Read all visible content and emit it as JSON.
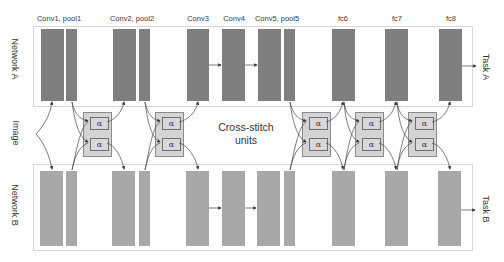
{
  "colors": {
    "network_a_block": "#7f7f7f",
    "network_b_block": "#a8a8a8",
    "cross_stitch_fill": "#d4d4d4",
    "box_border": "#d6d6d6"
  },
  "networks": {
    "a": {
      "label": "Network A",
      "task": "Task A"
    },
    "b": {
      "label": "Network B",
      "task": "Task B"
    }
  },
  "input_label": "Image",
  "cross_stitch_label_line1": "Cross-stitch",
  "cross_stitch_label_line2": "units",
  "alpha_symbol": "α",
  "layers": [
    {
      "label": "Conv1, pool1"
    },
    {
      "label": "Conv2, pool2"
    },
    {
      "label": "Conv3"
    },
    {
      "label": "Conv4"
    },
    {
      "label": "Conv5, pool5"
    },
    {
      "label": "fc6"
    },
    {
      "label": "fc7"
    },
    {
      "label": "fc8"
    }
  ],
  "cross_stitch_units_count": 5
}
